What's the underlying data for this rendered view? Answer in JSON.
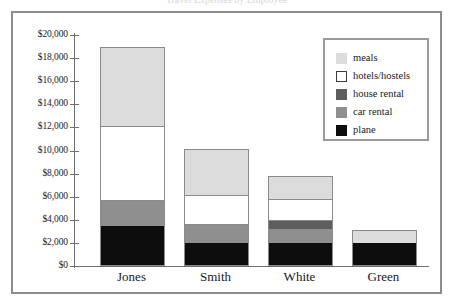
{
  "title_cropped": "Travel Expenses by Employee",
  "chart_data": {
    "type": "bar",
    "stacked": true,
    "title": "",
    "xlabel": "",
    "ylabel": "",
    "ylim": [
      0,
      20000
    ],
    "ytick_step": 2000,
    "grid": false,
    "legend_position": "top-right",
    "categories": [
      "Jones",
      "Smith",
      "White",
      "Green"
    ],
    "ytick_labels": [
      "$0",
      "$2,000",
      "$4,000",
      "$6,000",
      "$8,000",
      "$10,000",
      "$12,000",
      "$14,000",
      "$16,000",
      "$18,000",
      "$20,000"
    ],
    "series": [
      {
        "name": "plane",
        "color": "#0d0d0d",
        "values": [
          3400,
          1900,
          1900,
          1900
        ]
      },
      {
        "name": "car rental",
        "color": "#8f8f8f",
        "values": [
          2100,
          1600,
          1200,
          0
        ]
      },
      {
        "name": "house rental",
        "color": "#5e5e5e",
        "values": [
          0,
          0,
          700,
          0
        ]
      },
      {
        "name": "hotels/hostels",
        "color": "#ffffff",
        "values": [
          6500,
          2600,
          1900,
          0
        ]
      },
      {
        "name": "meals",
        "color": "#dcdcdc",
        "values": [
          6800,
          3900,
          1900,
          1050
        ]
      }
    ],
    "totals": [
      18800,
      10000,
      7600,
      2950
    ]
  },
  "legend": {
    "items": [
      {
        "label": "meals",
        "color": "#dcdcdc"
      },
      {
        "label": "hotels/hostels",
        "color": "#ffffff"
      },
      {
        "label": "house rental",
        "color": "#5e5e5e"
      },
      {
        "label": "car rental",
        "color": "#8f8f8f"
      },
      {
        "label": "plane",
        "color": "#0d0d0d"
      }
    ]
  },
  "colors": {
    "frame": "#8c8c8c",
    "axis": "#6f6f6f",
    "bar_outline": "#8a8a8a",
    "background": "#ffffff"
  }
}
